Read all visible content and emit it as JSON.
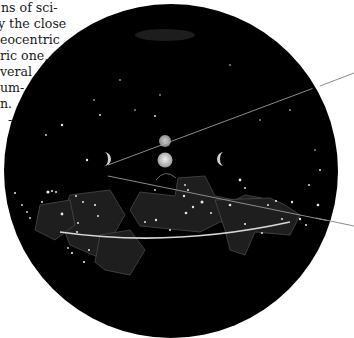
{
  "text_fragment": {
    "lines": [
      {
        "text": "ns of sci-",
        "x": 1,
        "y": 0
      },
      {
        "text": "y the close",
        "x": -2,
        "y": 16
      },
      {
        "text": "eocentric",
        "x": 0,
        "y": 32
      },
      {
        "text": "ric one,",
        "x": 0,
        "y": 48
      },
      {
        "text": "veral",
        "x": 0,
        "y": 64
      },
      {
        "text": "um-",
        "x": 0,
        "y": 80
      },
      {
        "text": "n.",
        "x": 0,
        "y": 96
      },
      {
        "text": "-",
        "x": 0,
        "y": 112
      }
    ]
  },
  "illustration": {
    "subject": "celestial sphere with ecliptic, planets and constellation boundaries",
    "sphere_color": "#000000",
    "star_color": "#e8e8e8",
    "line_color": "#8a8a8a",
    "ecliptic_color": "#d8d8d8"
  }
}
